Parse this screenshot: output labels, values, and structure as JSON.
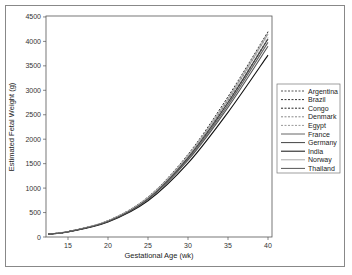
{
  "chart_data": {
    "type": "line",
    "title": "",
    "xlabel": "Gestational Age (wk)",
    "ylabel": "Estimated Fetal Weight (g)",
    "xlim": [
      12,
      40
    ],
    "ylim": [
      0,
      4500
    ],
    "xticks": [
      15,
      20,
      25,
      30,
      35,
      40
    ],
    "yticks": [
      0,
      500,
      1000,
      1500,
      2000,
      2500,
      3000,
      3500,
      4000,
      4500
    ],
    "x": [
      12.5,
      15,
      20,
      25,
      30,
      35,
      40
    ],
    "series": [
      {
        "name": "Argentina",
        "style": "dashed",
        "color": "#555555",
        "values": [
          60,
          110,
          330,
          800,
          1650,
          2800,
          4150
        ]
      },
      {
        "name": "Brazil",
        "style": "dashed",
        "color": "#333333",
        "values": [
          60,
          110,
          335,
          820,
          1690,
          2870,
          4200
        ]
      },
      {
        "name": "Congo",
        "style": "dashed",
        "color": "#222222",
        "values": [
          60,
          108,
          325,
          790,
          1620,
          2740,
          4050
        ]
      },
      {
        "name": "Denmark",
        "style": "dashed",
        "color": "#888888",
        "values": [
          60,
          110,
          332,
          810,
          1670,
          2840,
          4180
        ]
      },
      {
        "name": "Egypt",
        "style": "dashed",
        "color": "#999999",
        "values": [
          60,
          109,
          328,
          795,
          1630,
          2760,
          4080
        ]
      },
      {
        "name": "France",
        "style": "solid",
        "color": "#666666",
        "values": [
          60,
          108,
          322,
          780,
          1600,
          2700,
          3980
        ]
      },
      {
        "name": "Germany",
        "style": "solid",
        "color": "#444444",
        "values": [
          60,
          109,
          326,
          790,
          1625,
          2750,
          4050
        ]
      },
      {
        "name": "India",
        "style": "solid",
        "color": "#111111",
        "values": [
          58,
          104,
          308,
          740,
          1510,
          2550,
          3720
        ]
      },
      {
        "name": "Norway",
        "style": "solid",
        "color": "#aaaaaa",
        "values": [
          60,
          110,
          330,
          805,
          1660,
          2820,
          4150
        ]
      },
      {
        "name": "Thailand",
        "style": "solid",
        "color": "#555555",
        "values": [
          59,
          106,
          316,
          765,
          1570,
          2650,
          3900
        ]
      }
    ],
    "legend_position": "right"
  }
}
